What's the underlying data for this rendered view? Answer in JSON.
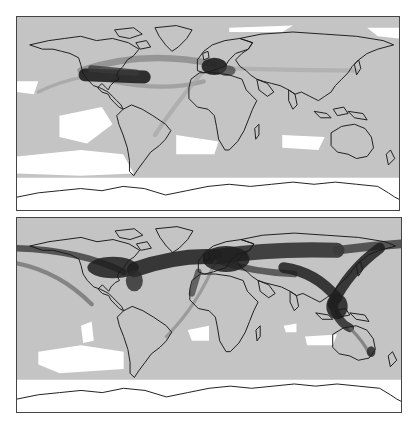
{
  "figure": {
    "type": "two-panel world density map",
    "projection": "equirectangular",
    "panels": [
      {
        "id": "top",
        "description": "Route density concentrated over North America and Europe with a North Atlantic corridor",
        "hotspots": [
          "North America",
          "Europe"
        ],
        "corridors": [
          "North Atlantic",
          "Europe to South America (faint)",
          "North Pacific (faint)"
        ]
      },
      {
        "id": "bottom",
        "description": "Dense global belt across northern hemisphere: North America, North Atlantic, Europe, Middle East, Asia, East Asia to Southeast Asia and Australia",
        "hotspots": [
          "North America",
          "Europe",
          "East Asia",
          "Southeast Asia",
          "Eastern Australia"
        ],
        "corridors": [
          "North Atlantic",
          "Europe to Asia",
          "Asia to Australia",
          "North Pacific"
        ]
      }
    ]
  },
  "colors": {
    "background": "#ffffff",
    "land_and_low_density": "#c4c4c4",
    "medium_density": "#8a8a8a",
    "high_density": "#1e1e1e",
    "no_data": "#ffffff",
    "coastline": "#1a1a1a",
    "frame": "#444444"
  }
}
